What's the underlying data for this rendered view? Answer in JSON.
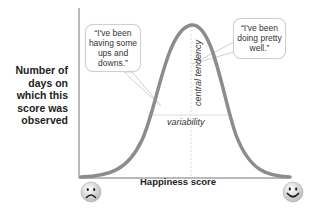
{
  "diagram": {
    "y_axis_label": "Number of days on which this score was observed",
    "x_axis_label": "Happiness score",
    "annotations": {
      "central_tendency": "central tendency",
      "variability": "variability"
    },
    "bubbles": {
      "left_quote": "“I've been having some ups and downs.”",
      "right_quote": "“I've been doing pretty well.”"
    },
    "icons": {
      "left_end": "sad-face-icon",
      "right_end": "happy-face-icon"
    },
    "caption": "",
    "colors": {
      "curve": "#8c8c8c",
      "axis": "#777777",
      "guide_lines": "#dddddd",
      "text": "#222222"
    }
  }
}
